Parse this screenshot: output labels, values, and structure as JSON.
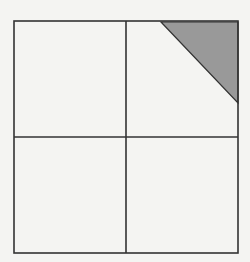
{
  "diagram": {
    "background": "#f4f4f2",
    "line_color": "#333333",
    "shade_color": "#999999",
    "outer_square": {
      "x1": 14,
      "y1": 21,
      "x2": 238,
      "y2": 253
    },
    "vertical_divider": {
      "x": 126,
      "y1": 21,
      "y2": 253
    },
    "horizontal_divider": {
      "y": 137,
      "x1": 14,
      "x2": 238
    },
    "shaded_triangle": {
      "points": [
        [
          161,
          22
        ],
        [
          238,
          22
        ],
        [
          238,
          103
        ]
      ]
    },
    "quadrants": [
      "top-left",
      "top-right",
      "bottom-left",
      "bottom-right"
    ]
  }
}
